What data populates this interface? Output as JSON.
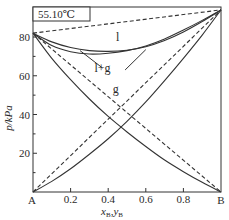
{
  "chart_data": {
    "type": "line",
    "title": "",
    "annotation_box": "55.10℃",
    "xlabel": "x_B, y_B",
    "xlabel_main": "x",
    "xlabel_sub1": "B",
    "xlabel_sep": ",",
    "xlabel_main2": "y",
    "xlabel_sub2": "B",
    "ylabel": "p/kPa",
    "xlim": [
      0,
      1
    ],
    "ylim": [
      0,
      95.5
    ],
    "x_ticks": [
      0.2,
      0.4,
      0.6,
      0.8
    ],
    "x_tick_labels": [
      "0.2",
      "0.4",
      "0.6",
      "0.8"
    ],
    "x_end_labels": [
      "A",
      "B"
    ],
    "y_ticks": [
      20,
      40,
      60,
      80
    ],
    "y_tick_labels": [
      "20",
      "40",
      "60",
      "80"
    ],
    "y_minor_ticks": [
      10,
      30,
      50,
      70,
      90
    ],
    "grid": false,
    "legend": null,
    "region_labels": [
      {
        "text": "l",
        "x": 0.45,
        "p": 78
      },
      {
        "text": "l+g",
        "x": 0.37,
        "p": 62
      },
      {
        "text": "g",
        "x": 0.44,
        "p": 51
      }
    ],
    "series": [
      {
        "name": "ideal total pressure (dashed)",
        "style": "dashed",
        "x": [
          0,
          1
        ],
        "p": [
          82,
          94
        ]
      },
      {
        "name": "liquid-phase line (p–x_B)",
        "style": "solid",
        "x": [
          0,
          0.1,
          0.2,
          0.3,
          0.4,
          0.5,
          0.6,
          0.7,
          0.8,
          0.9,
          1.0
        ],
        "p": [
          82,
          77.5,
          74.6,
          73.0,
          72.6,
          73.2,
          75.0,
          78.2,
          82.6,
          88.0,
          94
        ]
      },
      {
        "name": "gas-phase line (p–y_B)",
        "style": "solid",
        "x": [
          0,
          0.1,
          0.2,
          0.3,
          0.4,
          0.5,
          0.6,
          0.7,
          0.8,
          0.9,
          1.0
        ],
        "p": [
          82,
          75.6,
          72.4,
          71.2,
          71.6,
          73.0,
          75.4,
          79.0,
          83.6,
          88.6,
          94
        ]
      },
      {
        "name": "ideal partial pressure p_A (dashed)",
        "style": "dashed",
        "x": [
          0,
          1
        ],
        "p": [
          82,
          0
        ]
      },
      {
        "name": "ideal partial pressure p_B (dashed)",
        "style": "dashed",
        "x": [
          0,
          1
        ],
        "p": [
          0,
          94
        ]
      },
      {
        "name": "real partial pressure p_A",
        "style": "solid",
        "x": [
          0,
          0.1,
          0.2,
          0.3,
          0.4,
          0.5,
          0.6,
          0.7,
          0.8,
          0.9,
          1.0
        ],
        "p": [
          82,
          69,
          58,
          48,
          39,
          31,
          23.5,
          16.5,
          10.5,
          5,
          0
        ]
      },
      {
        "name": "real partial pressure p_B",
        "style": "solid",
        "x": [
          0,
          0.1,
          0.2,
          0.3,
          0.4,
          0.5,
          0.6,
          0.7,
          0.8,
          0.9,
          1.0
        ],
        "p": [
          0,
          5.5,
          12,
          19.5,
          27.5,
          36.5,
          46.5,
          57.5,
          69,
          81,
          94
        ]
      }
    ],
    "leader_lines": [
      {
        "from": [
          0.37,
          64
        ],
        "to": [
          0.25,
          73
        ]
      },
      {
        "from": [
          0.49,
          63
        ],
        "to": [
          0.6,
          73.5
        ]
      }
    ]
  }
}
